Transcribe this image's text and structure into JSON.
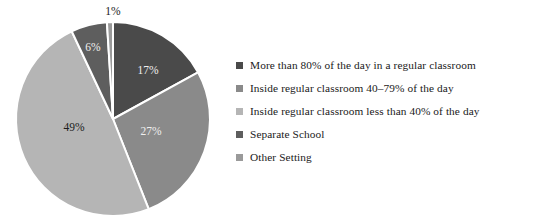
{
  "chart_data": {
    "type": "pie",
    "title": "",
    "labels": [
      "More than 80% of the day in a regular classroom",
      "Inside regular classroom 40–79% of the day",
      "Inside regular classroom less than 40% of the day",
      "Separate School",
      "Other Setting"
    ],
    "values": [
      17,
      27,
      49,
      6,
      1
    ],
    "value_labels": [
      "17%",
      "27%",
      "49%",
      "6%",
      "1%"
    ],
    "colors": [
      "#4a4a4a",
      "#8a8a8a",
      "#b5b5b5",
      "#5e5e5e",
      "#9a9a9a"
    ],
    "units": "percent",
    "legend_position": "right",
    "start_angle_deg": 0,
    "direction": "clockwise",
    "separator_color": "#ffffff"
  },
  "pie": {
    "center_x": 113,
    "center_y": 119,
    "radius": 97,
    "slices": [
      {
        "name": "regular-classroom-80-plus",
        "value": 17,
        "label": "17%",
        "color": "#4a4a4a",
        "label_color": "light",
        "label_x": 148,
        "label_y": 71
      },
      {
        "name": "regular-classroom-40-79",
        "value": 27,
        "label": "27%",
        "color": "#8a8a8a",
        "label_color": "light",
        "label_x": 151,
        "label_y": 132
      },
      {
        "name": "regular-classroom-less-40",
        "value": 49,
        "label": "49%",
        "color": "#b5b5b5",
        "label_color": "dark",
        "label_x": 74,
        "label_y": 128
      },
      {
        "name": "separate-school",
        "value": 6,
        "label": "6%",
        "color": "#5e5e5e",
        "label_color": "light",
        "label_x": 93,
        "label_y": 48
      },
      {
        "name": "other-setting",
        "value": 1,
        "label": "1%",
        "color": "#9a9a9a",
        "label_color": "dark",
        "label_x": 113,
        "label_y": 12
      }
    ]
  },
  "legend": {
    "items": [
      {
        "label": "More than 80% of the day in a regular classroom",
        "color": "#4a4a4a",
        "name": "legend-item-regular-classroom-80-plus"
      },
      {
        "label": "Inside regular classroom 40–79% of the day",
        "color": "#8a8a8a",
        "name": "legend-item-regular-classroom-40-79"
      },
      {
        "label": "Inside regular classroom less than 40% of the day",
        "color": "#b5b5b5",
        "name": "legend-item-regular-classroom-less-40"
      },
      {
        "label": "Separate School",
        "color": "#5e5e5e",
        "name": "legend-item-separate-school"
      },
      {
        "label": "Other Setting",
        "color": "#9a9a9a",
        "name": "legend-item-other-setting"
      }
    ]
  }
}
